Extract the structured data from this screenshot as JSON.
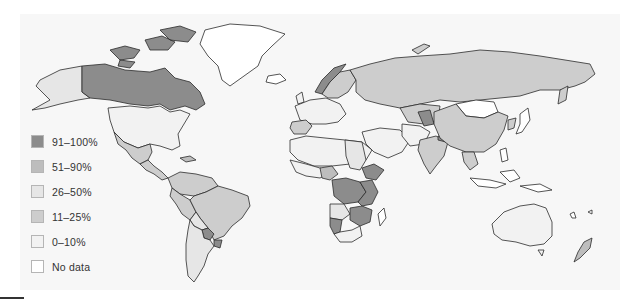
{
  "map": {
    "type": "choropleth",
    "projection": "world",
    "background": "#f7f7f7",
    "stroke": "#2b2b2b"
  },
  "legend": {
    "items": [
      {
        "label": "91–100%",
        "color": "#8c8c8c"
      },
      {
        "label": "51–90%",
        "color": "#bdbdbd"
      },
      {
        "label": "26–50%",
        "color": "#e6e6e6"
      },
      {
        "label": "11–25%",
        "color": "#cdcdcd"
      },
      {
        "label": "0–10%",
        "color": "#f2f2f2"
      },
      {
        "label": "No data",
        "color": "#ffffff"
      }
    ]
  },
  "regions": {
    "canada": "91–100%",
    "alaska_usa": "26–50%",
    "usa": "0–10%",
    "greenland": "No data",
    "mexico": "11–25%",
    "central_america": "11–25%",
    "brazil": "11–25%",
    "andean": "11–25%",
    "bolivia": "26–50%",
    "argentina": "26–50%",
    "paraguay": "91–100%",
    "uruguay": "91–100%",
    "norway": "91–100%",
    "sweden_finland": "11–25%",
    "russia": "11–25%",
    "western_europe": "0–10%",
    "spain_portugal": "11–25%",
    "china": "11–25%",
    "mongolia": "No data",
    "india": "11–25%",
    "nepal_region": "91–100%",
    "central_asia_dark": "91–100%",
    "north_africa": "0–10%",
    "sudan_region": "26–50%",
    "ethiopia": "91–100%",
    "central_africa": "91–100%",
    "angola": "26–50%",
    "namibia": "91–100%",
    "mozambique_zambia": "91–100%",
    "south_africa": "0–10%",
    "madagascar": "No data",
    "australia": "0–10%",
    "new_zealand": "51–90%",
    "japan": "No data",
    "korea": "11–25%",
    "se_asia": "11–25%"
  }
}
